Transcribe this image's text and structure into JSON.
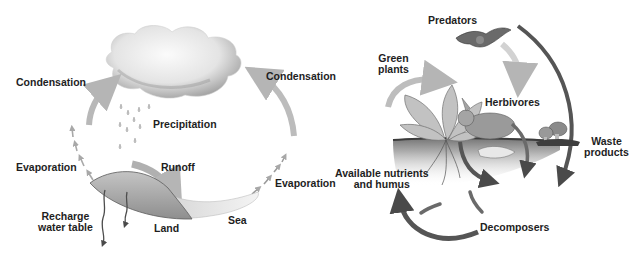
{
  "water_cycle": {
    "labels": {
      "condensation_left": "Condensation",
      "condensation_right": "Condensation",
      "precipitation": "Precipitation",
      "evaporation_left": "Evaporation",
      "evaporation_right": "Evaporation",
      "runoff": "Runoff",
      "recharge_line1": "Recharge",
      "recharge_line2": "water table",
      "land": "Land",
      "sea": "Sea"
    }
  },
  "nutrient_cycle": {
    "labels": {
      "predators": "Predators",
      "green_plants_line1": "Green",
      "green_plants_line2": "plants",
      "herbivores": "Herbivores",
      "waste_line1": "Waste",
      "waste_line2": "products",
      "nutrients_line1": "Available nutrients",
      "nutrients_line2": "and humus",
      "decomposers": "Decomposers"
    }
  },
  "colors": {
    "text": "#1e1e1e",
    "arrow_light": "#bdbdbd",
    "arrow_dark": "#555555",
    "land": "#a8a8a8",
    "sea": "#e6e6e6"
  }
}
